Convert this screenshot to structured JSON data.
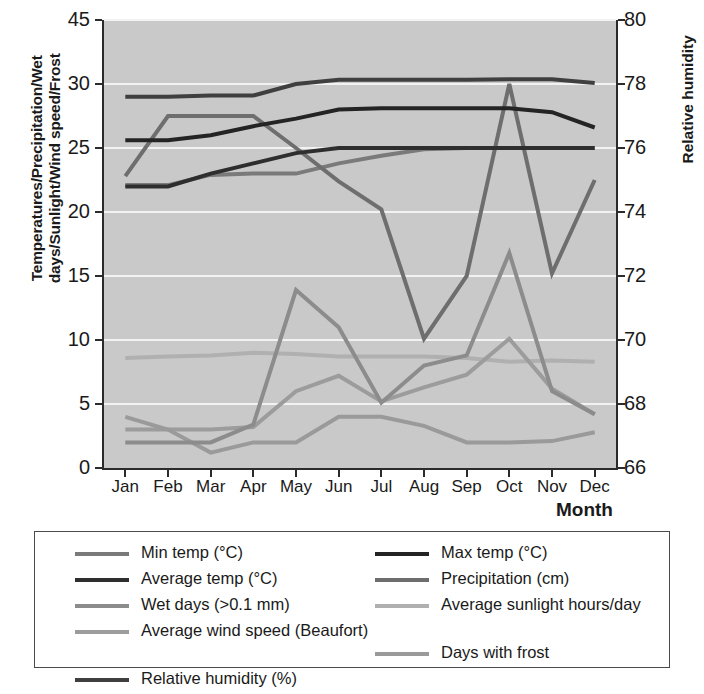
{
  "axes": {
    "y_left_title": "Temperatures/Precipitation/Wet days/Sunlight/Wind speed/Frost",
    "y_right_title": "Relative humidity",
    "x_title": "Month"
  },
  "legend": {
    "col1": [
      {
        "label": "Min temp (°C)",
        "color": "#7a7a7a"
      },
      {
        "label": "Average temp (°C)",
        "color": "#2e2e2e"
      },
      {
        "label": "Wet days (>0.1 mm)",
        "color": "#8c8c8c"
      },
      {
        "label": "Average wind speed (Beaufort)",
        "color": "#9c9c9c"
      },
      {
        "label": "Relative humidity (%)",
        "color": "#3f3f3f"
      }
    ],
    "col2": [
      {
        "label": "Max temp (°C)",
        "color": "#242424"
      },
      {
        "label": "Precipitation (cm)",
        "color": "#6e6e6e"
      },
      {
        "label": "Average sunlight hours/day",
        "color": "#b0b0b0"
      },
      {
        "label": "Days with frost",
        "color": "#9a9a9a"
      }
    ]
  },
  "chart_data": {
    "type": "line",
    "title": "",
    "xlabel": "Month",
    "ylabel": "Temperatures/Precipitation/Wet days/Sunlight/Wind speed/Frost",
    "y2label": "Relative humidity",
    "categories": [
      "Jan",
      "Feb",
      "Mar",
      "Apr",
      "May",
      "Jun",
      "Jul",
      "Aug",
      "Sep",
      "Oct",
      "Nov",
      "Dec"
    ],
    "ylim": [
      0,
      45
    ],
    "yticks": [
      0,
      5,
      10,
      15,
      20,
      25,
      30,
      45
    ],
    "y2lim": [
      66,
      80
    ],
    "y2ticks": [
      66,
      68,
      70,
      72,
      74,
      76,
      78,
      80
    ],
    "grid": true,
    "legend_position": "bottom",
    "series": [
      {
        "name": "Relative humidity (%)",
        "axis": "right",
        "color": "#3f3f3f",
        "values_left_scale": [
          29.0,
          29.0,
          29.1,
          29.1,
          30.0,
          31.0,
          31.0,
          31.0,
          31.0,
          31.1,
          31.1,
          30.2
        ],
        "values": [
          77.9,
          77.9,
          77.9,
          77.9,
          78.2,
          78.5,
          78.5,
          78.5,
          78.5,
          78.6,
          78.6,
          78.3
        ]
      },
      {
        "name": "Max temp (°C)",
        "axis": "left",
        "color": "#242424",
        "values": [
          25.6,
          25.6,
          26.0,
          26.7,
          27.3,
          28.0,
          28.1,
          28.1,
          28.1,
          28.1,
          27.8,
          26.6
        ]
      },
      {
        "name": "Average temp (°C)",
        "axis": "left",
        "color": "#2e2e2e",
        "values": [
          22.0,
          22.0,
          23.0,
          23.8,
          24.6,
          25.0,
          25.0,
          25.0,
          25.0,
          25.0,
          25.0,
          25.0
        ]
      },
      {
        "name": "Min temp (°C)",
        "axis": "left",
        "color": "#7a7a7a",
        "values": [
          22.1,
          22.1,
          22.9,
          23.0,
          23.0,
          23.8,
          24.4,
          24.9,
          25.0,
          25.0,
          25.0,
          25.0
        ]
      },
      {
        "name": "Precipitation (cm)",
        "axis": "left",
        "color": "#6e6e6e",
        "values": [
          22.8,
          27.5,
          27.5,
          27.5,
          25.0,
          22.4,
          20.2,
          10.1,
          15.0,
          30.0,
          15.2,
          22.5
        ]
      },
      {
        "name": "Wet days (>0.1 mm)",
        "axis": "left",
        "color": "#8c8c8c",
        "values": [
          2.0,
          2.0,
          2.0,
          3.4,
          13.9,
          11.0,
          5.1,
          8.0,
          8.8,
          16.8,
          6.0,
          4.2
        ]
      },
      {
        "name": "Average sunlight hours/day",
        "axis": "left",
        "color": "#b0b0b0",
        "values": [
          8.6,
          8.7,
          8.8,
          9.0,
          8.9,
          8.7,
          8.7,
          8.7,
          8.6,
          8.3,
          8.4,
          8.3
        ]
      },
      {
        "name": "Average wind speed (Beaufort)",
        "axis": "left",
        "color": "#9c9c9c",
        "values": [
          3.0,
          3.0,
          3.0,
          3.2,
          6.0,
          7.2,
          5.2,
          6.3,
          7.3,
          10.1,
          6.2,
          4.2
        ]
      },
      {
        "name": "Days with frost",
        "axis": "left",
        "color": "#9a9a9a",
        "values": [
          4.0,
          3.0,
          1.2,
          2.0,
          2.0,
          4.0,
          4.0,
          3.3,
          2.0,
          2.0,
          2.1,
          2.8
        ]
      }
    ]
  }
}
